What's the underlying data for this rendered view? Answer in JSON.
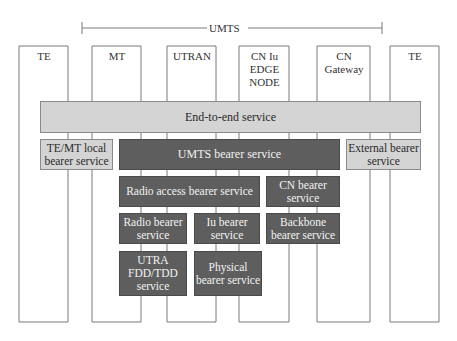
{
  "diagram": {
    "scope_label": "UMTS",
    "columns": [
      {
        "label": "TE"
      },
      {
        "label": "MT"
      },
      {
        "label": "UTRAN"
      },
      {
        "label": "CN Iu\nEDGE\nNODE"
      },
      {
        "label": "CN\nGateway"
      },
      {
        "label": "TE"
      }
    ],
    "services": {
      "end_to_end": "End-to-end service",
      "te_mt_local": "TE/MT local bearer service",
      "umts_bearer": "UMTS bearer service",
      "external_bearer": "External bearer service",
      "radio_access_bearer": "Radio access bearer service",
      "cn_bearer": "CN bearer service",
      "radio_bearer": "Radio bearer service",
      "iu_bearer": "Iu bearer service",
      "backbone_bearer": "Backbone bearer service",
      "utra_fdd_tdd": "UTRA FDD/TDD service",
      "physical_bearer": "Physical bearer service"
    },
    "colors": {
      "light_box": "#d4d4d4",
      "dark_box": "#5e5e5e",
      "line": "#7a7a7a"
    }
  }
}
